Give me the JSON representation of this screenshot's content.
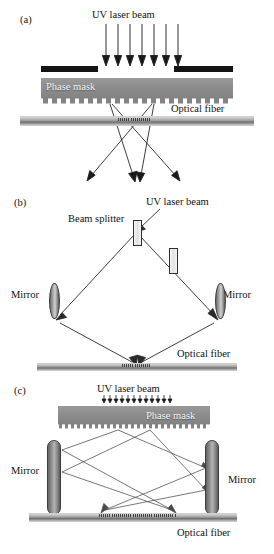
{
  "figure": {
    "panels": [
      {
        "tag": "(a)",
        "name": "phase-mask-method",
        "labels": {
          "uv_beam": "UV laser beam",
          "phase_mask": "Phase mask",
          "optical_fiber": "Optical fiber"
        },
        "incident_arrow_count": 7,
        "diffracted_beam_count": 4,
        "aperture_bars": 2
      },
      {
        "tag": "(b)",
        "name": "interferometer-method",
        "labels": {
          "uv_beam": "UV laser beam",
          "beam_splitter": "Beam splitter",
          "mirror_left": "Mirror",
          "mirror_right": "Mirror",
          "optical_fiber": "Optical fiber"
        }
      },
      {
        "tag": "(c)",
        "name": "phase-mask-interferometer-method",
        "labels": {
          "uv_beam": "UV laser beam",
          "phase_mask": "Phase mask",
          "mirror_left": "Mirror",
          "mirror_right": "Mirror",
          "optical_fiber": "Optical fiber"
        },
        "incident_arrow_count": 12
      }
    ],
    "colors": {
      "mask_gray": "#8d8d8d",
      "bar_black": "#141414",
      "fiber_gray": "#9a9a9a",
      "line_black": "#1a1a1a",
      "mask_text": "#f2f2f2"
    }
  }
}
